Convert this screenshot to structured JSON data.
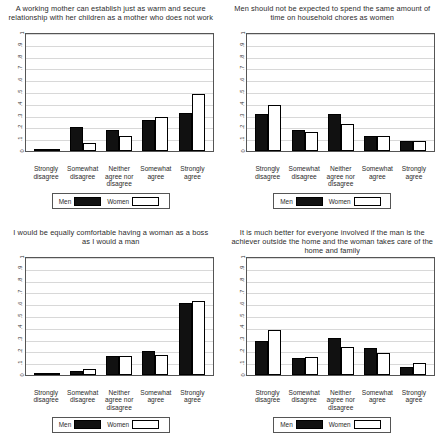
{
  "figure": {
    "legend": {
      "men_label": "Men",
      "women_label": "Women"
    },
    "categories": [
      "Strongly disagree",
      "Somewhat disagree",
      "Neither agree nor disagree",
      "Somewhat agree",
      "Strongly agree"
    ],
    "yticks": [
      "1",
      ".9",
      ".8",
      ".7",
      ".6",
      ".5",
      ".4",
      ".3",
      ".2",
      ".1",
      "0"
    ]
  },
  "chart_data": [
    {
      "type": "bar",
      "title": "A working mother can establish just as warm and secure relationship with her children as a mother who does not work",
      "categories": [
        "Strongly disagree",
        "Somewhat disagree",
        "Neither agree nor disagree",
        "Somewhat agree",
        "Strongly agree"
      ],
      "series": [
        {
          "name": "Men",
          "values": [
            0.02,
            0.2,
            0.18,
            0.26,
            0.32
          ]
        },
        {
          "name": "Women",
          "values": [
            0.015,
            0.07,
            0.13,
            0.29,
            0.48
          ]
        }
      ],
      "xlabel": "",
      "ylabel": "",
      "ylim": [
        0,
        1
      ],
      "yticks": [
        0,
        0.1,
        0.2,
        0.3,
        0.4,
        0.5,
        0.6,
        0.7,
        0.8,
        0.9,
        1
      ],
      "grid": true,
      "legend_position": "bottom"
    },
    {
      "type": "bar",
      "title": "Men should not be expected to spend the same amount of time on household chores as women",
      "categories": [
        "Strongly disagree",
        "Somewhat disagree",
        "Neither agree nor disagree",
        "Somewhat agree",
        "Strongly agree"
      ],
      "series": [
        {
          "name": "Men",
          "values": [
            0.31,
            0.18,
            0.31,
            0.13,
            0.08
          ]
        },
        {
          "name": "Women",
          "values": [
            0.39,
            0.16,
            0.23,
            0.13,
            0.08
          ]
        }
      ],
      "xlabel": "",
      "ylabel": "",
      "ylim": [
        0,
        1
      ],
      "yticks": [
        0,
        0.1,
        0.2,
        0.3,
        0.4,
        0.5,
        0.6,
        0.7,
        0.8,
        0.9,
        1
      ],
      "grid": true,
      "legend_position": "bottom"
    },
    {
      "type": "bar",
      "title": "I would be equally comfortable having a woman as a boss as I would a man",
      "categories": [
        "Strongly disagree",
        "Somewhat disagree",
        "Neither agree nor disagree",
        "Somewhat agree",
        "Strongly agree"
      ],
      "series": [
        {
          "name": "Men",
          "values": [
            0.01,
            0.03,
            0.155,
            0.2,
            0.6
          ]
        },
        {
          "name": "Women",
          "values": [
            0.01,
            0.05,
            0.155,
            0.165,
            0.62
          ]
        }
      ],
      "xlabel": "",
      "ylabel": "",
      "ylim": [
        0,
        1
      ],
      "yticks": [
        0,
        0.1,
        0.2,
        0.3,
        0.4,
        0.5,
        0.6,
        0.7,
        0.8,
        0.9,
        1
      ],
      "grid": true,
      "legend_position": "bottom"
    },
    {
      "type": "bar",
      "title": "It is much better for everyone involved if the man is the achiever outside the home and the woman takes care of the home and family",
      "categories": [
        "Strongly disagree",
        "Somewhat disagree",
        "Neither agree nor disagree",
        "Somewhat agree",
        "Strongly agree"
      ],
      "series": [
        {
          "name": "Men",
          "values": [
            0.28,
            0.14,
            0.31,
            0.22,
            0.06
          ]
        },
        {
          "name": "Women",
          "values": [
            0.37,
            0.15,
            0.23,
            0.18,
            0.1
          ]
        }
      ],
      "xlabel": "",
      "ylabel": "",
      "ylim": [
        0,
        1
      ],
      "yticks": [
        0,
        0.1,
        0.2,
        0.3,
        0.4,
        0.5,
        0.6,
        0.7,
        0.8,
        0.9,
        1
      ],
      "grid": true,
      "legend_position": "bottom"
    }
  ]
}
